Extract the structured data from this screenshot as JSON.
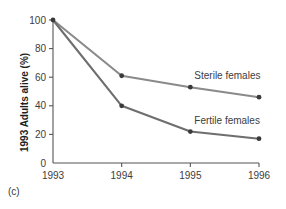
{
  "panel": {
    "label": "(c)"
  },
  "chart_data": {
    "type": "line",
    "title": "",
    "xlabel": "",
    "ylabel": "1993 Adults alive (%)",
    "x": [
      "1993",
      "1994",
      "1995",
      "1996"
    ],
    "categories": [
      "1993",
      "1994",
      "1995",
      "1996"
    ],
    "series": [
      {
        "name": "Sterile females",
        "values": [
          100,
          61,
          53,
          46
        ],
        "color": "#8a8a8a",
        "marker": "circle",
        "label_x": "1995",
        "label_text": "Sterile females"
      },
      {
        "name": "Fertile females",
        "values": [
          100,
          40,
          22,
          17
        ],
        "color": "#6e6e6e",
        "marker": "circle",
        "label_x": "1995",
        "label_text": "Fertile females"
      }
    ],
    "ylim": [
      0,
      100
    ],
    "yticks": [
      0,
      20,
      40,
      60,
      80,
      100
    ],
    "ytick_labels": [
      "0",
      "20",
      "40",
      "60",
      "80",
      "100"
    ],
    "xtick_labels": [
      "1993",
      "1994",
      "1995",
      "1996"
    ],
    "grid": false,
    "legend": "inline-annotations",
    "legend_position": "inline",
    "axis_color": "#555555",
    "text_color": "#3d3d3d"
  }
}
